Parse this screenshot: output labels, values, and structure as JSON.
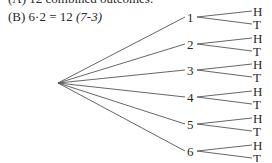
{
  "text": {
    "line_a": "(A) 12 combined outcomes.",
    "line_b_label": "(B)",
    "line_b_expr": "6·2 = 12",
    "line_b_ref": "(7-3)"
  },
  "tree": {
    "root": {
      "x": 58,
      "y": 83
    },
    "first_stage": [
      "1",
      "2",
      "3",
      "4",
      "5",
      "6"
    ],
    "second_stage": [
      "H",
      "T"
    ]
  }
}
